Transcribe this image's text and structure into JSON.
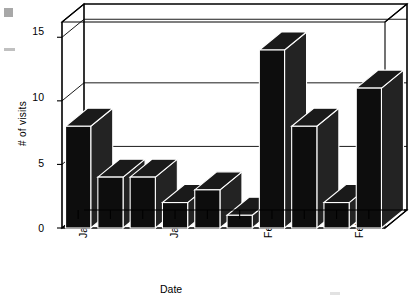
{
  "chart_data": {
    "type": "bar",
    "title": "",
    "xlabel": "Date",
    "ylabel": "# of visits",
    "categories": [
      "Jan 13",
      "Jan 14",
      "Jan 15",
      "Jan 19",
      "Jan 20",
      "Jan 21",
      "Feb 1",
      "Feb 2",
      "Feb 3",
      "Feb 5"
    ],
    "values": [
      8,
      4,
      4,
      2,
      3,
      1,
      14,
      8,
      2,
      11
    ],
    "ylim": [
      0,
      16.2
    ],
    "yticks": [
      "0",
      "5",
      "10",
      "15"
    ],
    "ytick_values": [
      0,
      5,
      10,
      15
    ],
    "xtick_labels": [
      "Jan 13",
      "Jan 19",
      "Feb 1",
      "Feb 5"
    ],
    "xtick_indices": [
      0,
      3,
      6,
      9
    ],
    "grid": true,
    "legend": "none",
    "style": "3d-bars",
    "bar_color": "#0d0d0d",
    "axis_color": "#000000",
    "background": "#ffffff"
  }
}
